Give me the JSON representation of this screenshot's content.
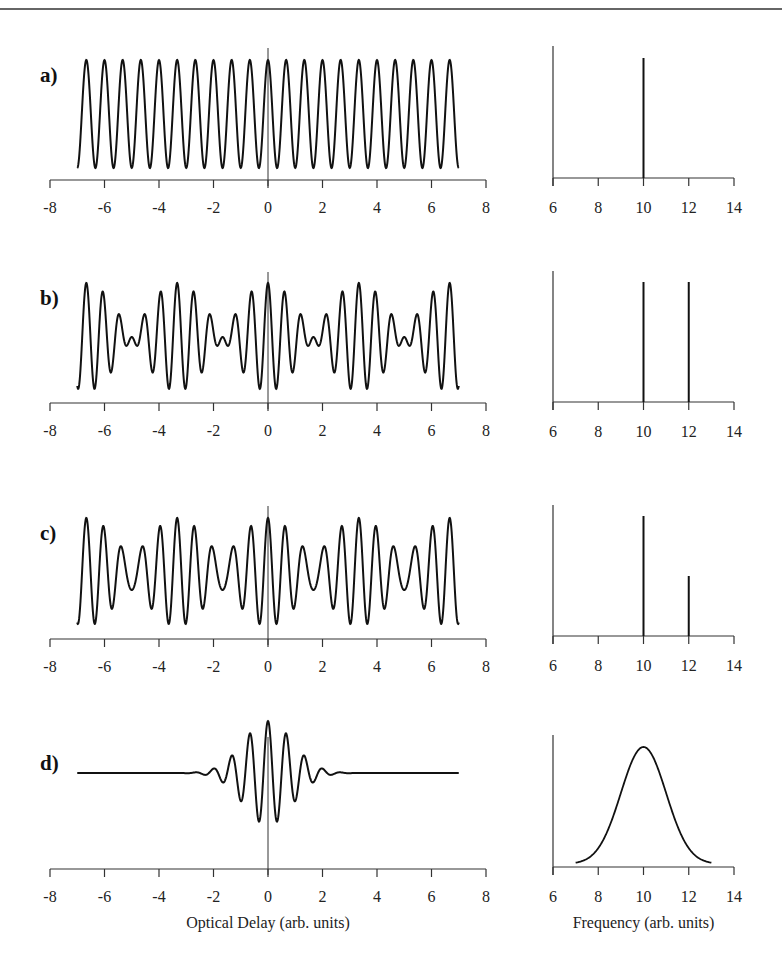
{
  "chart_data": [
    {
      "panel": "a)",
      "type": "line",
      "title": "",
      "xlabel": "",
      "xlim": [
        -8,
        8
      ],
      "xticks": [
        -8,
        -6,
        -4,
        -2,
        0,
        2,
        4,
        6,
        8
      ],
      "signal": "interferogram",
      "x_range": [
        -7,
        7
      ],
      "components": [
        {
          "frequency": 10,
          "amplitude": 1.0
        }
      ],
      "description": "Pure cosine at single frequency, constant amplitude"
    },
    {
      "panel": "a)",
      "type": "bar",
      "subtype": "spectrum-lines",
      "xlim": [
        6,
        14
      ],
      "xticks": [
        6,
        8,
        10,
        12,
        14
      ],
      "lines": [
        {
          "x": 10,
          "height": 1.0
        }
      ]
    },
    {
      "panel": "b)",
      "type": "line",
      "xlim": [
        -8,
        8
      ],
      "xticks": [
        -8,
        -6,
        -4,
        -2,
        0,
        2,
        4,
        6,
        8
      ],
      "x_range": [
        -7,
        7
      ],
      "components": [
        {
          "frequency": 10,
          "amplitude": 0.5
        },
        {
          "frequency": 12,
          "amplitude": 0.5
        }
      ],
      "description": "Two equal-amplitude cosines producing beats"
    },
    {
      "panel": "b)",
      "type": "bar",
      "subtype": "spectrum-lines",
      "xlim": [
        6,
        14
      ],
      "xticks": [
        6,
        8,
        10,
        12,
        14
      ],
      "lines": [
        {
          "x": 10,
          "height": 1.0
        },
        {
          "x": 12,
          "height": 1.0
        }
      ]
    },
    {
      "panel": "c)",
      "type": "line",
      "xlim": [
        -8,
        8
      ],
      "xticks": [
        -8,
        -6,
        -4,
        -2,
        0,
        2,
        4,
        6,
        8
      ],
      "x_range": [
        -7,
        7
      ],
      "components": [
        {
          "frequency": 10,
          "amplitude": 0.667
        },
        {
          "frequency": 12,
          "amplitude": 0.333
        }
      ],
      "description": "Two unequal-amplitude cosines producing partial beats"
    },
    {
      "panel": "c)",
      "type": "bar",
      "subtype": "spectrum-lines",
      "xlim": [
        6,
        14
      ],
      "xticks": [
        6,
        8,
        10,
        12,
        14
      ],
      "lines": [
        {
          "x": 10,
          "height": 1.0
        },
        {
          "x": 12,
          "height": 0.5
        }
      ]
    },
    {
      "panel": "d)",
      "type": "line",
      "xlim": [
        -8,
        8
      ],
      "xticks": [
        -8,
        -6,
        -4,
        -2,
        0,
        2,
        4,
        6,
        8
      ],
      "x_range": [
        -7,
        7
      ],
      "xlabel": "Optical Delay (arb. units)",
      "components": "gaussian band centered at 10",
      "description": "Wave packet: cosine with Gaussian envelope, centered at 0, offset baseline"
    },
    {
      "panel": "d)",
      "type": "line",
      "xlim": [
        6,
        14
      ],
      "xticks": [
        6,
        8,
        10,
        12,
        14
      ],
      "xlabel": "Frequency (arb. units)",
      "gaussian": {
        "center": 10,
        "sigma": 1.0,
        "x_range": [
          7,
          13
        ],
        "peak": 1.0
      }
    }
  ],
  "panels": [
    {
      "label": "a)"
    },
    {
      "label": "b)"
    },
    {
      "label": "c)"
    },
    {
      "label": "d)"
    }
  ],
  "axes": {
    "delay_ticks": [
      "-8",
      "-6",
      "-4",
      "-2",
      "0",
      "2",
      "4",
      "6",
      "8"
    ],
    "freq_ticks": [
      "6",
      "8",
      "10",
      "12",
      "14"
    ],
    "delay_title": "Optical Delay (arb. units)",
    "freq_title": "Frequency (arb. units)"
  }
}
